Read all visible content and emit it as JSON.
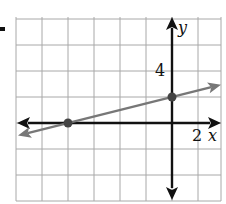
{
  "chart_data": {
    "type": "line",
    "title": "",
    "xlabel": "x",
    "ylabel": "y",
    "grid": true,
    "grid_step": 2,
    "xlim": [
      -12,
      4
    ],
    "ylim": [
      -6,
      8
    ],
    "x_tick_labels": [
      {
        "value": 2,
        "label": "2"
      }
    ],
    "y_tick_labels": [
      {
        "value": 4,
        "label": "4"
      }
    ],
    "series": [
      {
        "name": "line",
        "equation": "y = 0.25x + 2",
        "slope": 0.25,
        "intercept": 2,
        "color": "#777777",
        "arrows": "both",
        "points": [
          {
            "x": -8,
            "y": 0
          },
          {
            "x": 0,
            "y": 2
          }
        ]
      }
    ],
    "axis_color": "#111111",
    "grid_color": "#aaaaaa"
  },
  "labels": {
    "x_axis": "x",
    "y_axis": "y",
    "x_tick": "2",
    "y_tick": "4"
  }
}
